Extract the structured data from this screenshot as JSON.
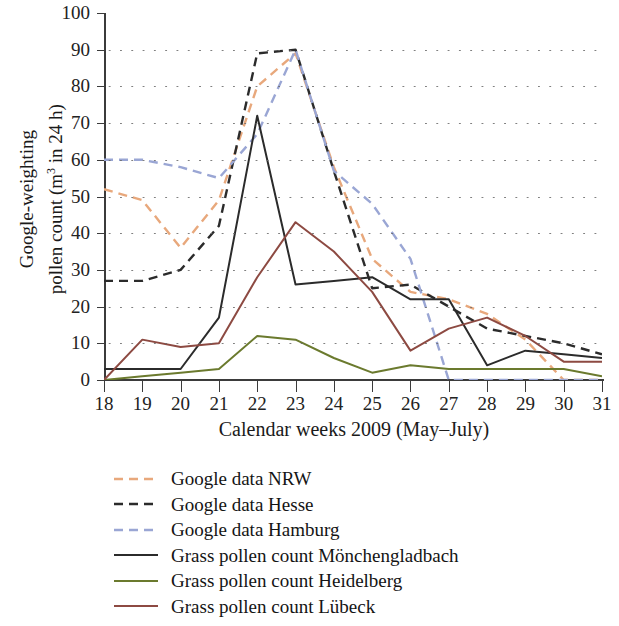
{
  "chart_data": {
    "type": "line",
    "title": "",
    "xlabel": "Calendar weeks 2009 (May–July)",
    "ylabel_line1": "Google-weighting",
    "ylabel_line2": "pollen count (m",
    "ylabel_sup": "3",
    "ylabel_line2b": " in 24 h)",
    "ylabel": "Google-weighting pollen count (m3 in 24 h)",
    "x": [
      18,
      19,
      20,
      21,
      22,
      23,
      24,
      25,
      26,
      27,
      28,
      29,
      30,
      31
    ],
    "categories": [
      "18",
      "19",
      "20",
      "21",
      "22",
      "23",
      "24",
      "25",
      "26",
      "27",
      "28",
      "29",
      "30",
      "31"
    ],
    "xtick_labels": [
      "18",
      "19",
      "20",
      "21",
      "22",
      "23",
      "24",
      "25",
      "26",
      "27",
      "28",
      "29",
      "30",
      "31"
    ],
    "ytick_labels": [
      "0",
      "10",
      "20",
      "30",
      "40",
      "50",
      "60",
      "70",
      "80",
      "90",
      "100"
    ],
    "ylim": [
      0,
      100
    ],
    "xlim": [
      18,
      31
    ],
    "ytick_step": 10,
    "grid": "horizontal-dotted",
    "legend_position": "below-plot-left",
    "series": [
      {
        "name": "Google data NRW",
        "color": "#e8a87c",
        "style": "dashed",
        "values": [
          52,
          49,
          36,
          49,
          80,
          89,
          58,
          33,
          24,
          22,
          18,
          11,
          0,
          0
        ]
      },
      {
        "name": "Google data Hesse",
        "color": "#2b2b2b",
        "style": "dashed",
        "values": [
          27,
          27,
          30,
          42,
          89,
          90,
          57,
          25,
          26,
          20,
          14,
          12,
          10,
          7
        ]
      },
      {
        "name": "Google data Hamburg",
        "color": "#9aa6d4",
        "style": "dashed",
        "values": [
          60,
          60,
          58,
          55,
          67,
          90,
          57,
          48,
          33,
          0,
          0,
          0,
          0,
          0
        ]
      },
      {
        "name": "Grass pollen count Mönchengladbach",
        "color": "#2b2b2b",
        "style": "solid",
        "values": [
          3,
          3,
          3,
          17,
          72,
          26,
          27,
          28,
          22,
          22,
          4,
          8,
          7,
          6
        ]
      },
      {
        "name": "Grass pollen count Heidelberg",
        "color": "#6b7a2e",
        "style": "solid",
        "values": [
          0,
          1,
          2,
          3,
          12,
          11,
          6,
          2,
          4,
          3,
          3,
          3,
          3,
          1
        ]
      },
      {
        "name": "Grass pollen count Lübeck",
        "color": "#8d4a42",
        "style": "solid",
        "values": [
          0,
          11,
          9,
          10,
          28,
          43,
          35,
          24,
          8,
          14,
          17,
          12,
          5,
          5
        ]
      }
    ]
  },
  "legend": {
    "items": [
      {
        "label": "Google data NRW",
        "color": "#e8a87c",
        "style": "dashed"
      },
      {
        "label": "Google data Hesse",
        "color": "#2b2b2b",
        "style": "dashed"
      },
      {
        "label": "Google data Hamburg",
        "color": "#9aa6d4",
        "style": "dashed"
      },
      {
        "label": "Grass pollen count Mönchengladbach",
        "color": "#2b2b2b",
        "style": "solid"
      },
      {
        "label": "Grass pollen count Heidelberg",
        "color": "#6b7a2e",
        "style": "solid"
      },
      {
        "label": "Grass pollen count Lübeck",
        "color": "#8d4a42",
        "style": "solid"
      }
    ]
  }
}
